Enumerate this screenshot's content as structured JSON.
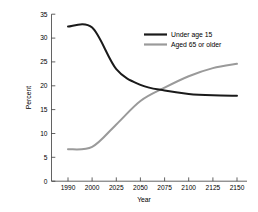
{
  "chart_data": {
    "type": "line",
    "title": "",
    "xlabel": "Year",
    "ylabel": "Percent",
    "grid": false,
    "legend_position": "top-right-inside",
    "ylim": [
      0,
      35
    ],
    "yticks": [
      0,
      5,
      10,
      15,
      20,
      25,
      30,
      35
    ],
    "categories": [
      "1990",
      "2000",
      "2025",
      "2050",
      "2075",
      "2100",
      "2125",
      "2150"
    ],
    "x": [
      1990,
      2000,
      2025,
      2050,
      2075,
      2100,
      2125,
      2150
    ],
    "series": [
      {
        "name": "Under age 15",
        "color": "#1a1a1a",
        "values": [
          32.4,
          32.2,
          23.5,
          20.2,
          19.0,
          18.3,
          18.0,
          17.9
        ]
      },
      {
        "name": "Aged 65 or older",
        "color": "#9a9a9a",
        "values": [
          6.7,
          7.2,
          11.9,
          16.8,
          19.6,
          22.0,
          23.7,
          24.6
        ]
      }
    ],
    "annotations": {
      "crossing_year": "2070",
      "crossing_percent": "19.2"
    }
  },
  "axes": {
    "ylabel": "Percent",
    "xlabel": "Year",
    "ytick_labels": [
      "0",
      "5",
      "10",
      "15",
      "20",
      "25",
      "30",
      "35"
    ],
    "xtick_labels": [
      "1990",
      "2000",
      "2025",
      "2050",
      "2075",
      "2100",
      "2125",
      "2150"
    ]
  },
  "legend": {
    "items": [
      {
        "label": "Under age 15",
        "color": "#1a1a1a"
      },
      {
        "label": "Aged 65 or older",
        "color": "#9a9a9a"
      }
    ]
  }
}
